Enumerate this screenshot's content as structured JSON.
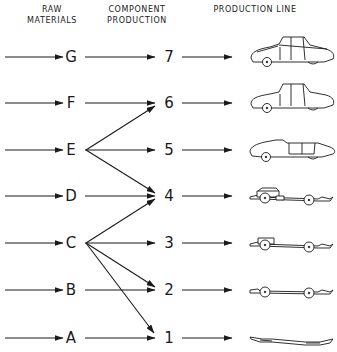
{
  "headers": {
    "raw_materials": [
      "RAW",
      "MATERIALS"
    ],
    "component_production": [
      "COMPONENT",
      "PRODUCTION"
    ],
    "production_line": "PRODUCTION LINE"
  },
  "rows": [
    {
      "material": "G",
      "component": "7",
      "product": "complete-car",
      "y": 57
    },
    {
      "material": "F",
      "component": "6",
      "product": "car-without-front-panels",
      "y": 103
    },
    {
      "material": "E",
      "component": "5",
      "product": "car-body-on-chassis",
      "y": 150
    },
    {
      "material": "D",
      "component": "4",
      "product": "chassis-with-engine-frame",
      "y": 196
    },
    {
      "material": "C",
      "component": "3",
      "product": "chassis-with-frame",
      "y": 243
    },
    {
      "material": "B",
      "component": "2",
      "product": "chassis-with-wheels",
      "y": 290
    },
    {
      "material": "A",
      "component": "1",
      "product": "bare-chassis-frame",
      "y": 338
    }
  ],
  "cross_links": [
    {
      "from": "E",
      "to": "6"
    },
    {
      "from": "E",
      "to": "4"
    },
    {
      "from": "C",
      "to": "4"
    },
    {
      "from": "C",
      "to": "2"
    },
    {
      "from": "C",
      "to": "1"
    }
  ],
  "colors": {
    "line": "#1a1a1a",
    "background": "#ffffff"
  }
}
